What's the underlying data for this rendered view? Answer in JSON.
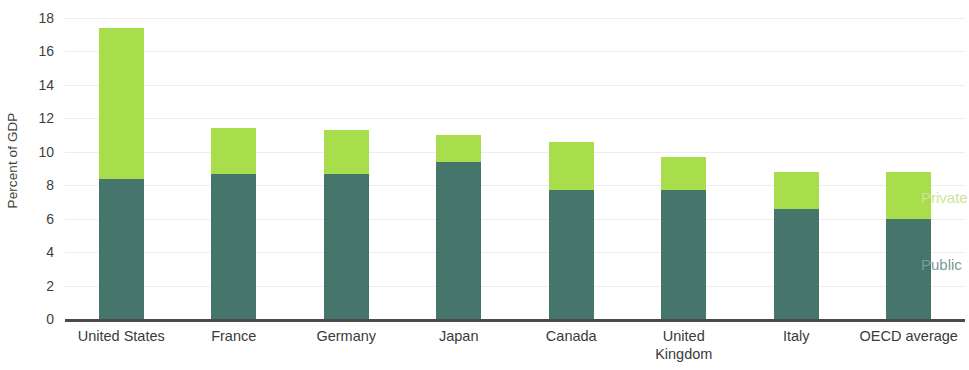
{
  "chart_data": {
    "type": "bar",
    "subtype": "stacked-vertical",
    "title": "",
    "xlabel": "",
    "ylabel": "Percent of GDP",
    "ylim": [
      0,
      18
    ],
    "ytick_step": 2,
    "ytick_labels": [
      "18",
      "16",
      "14",
      "12",
      "10",
      "8",
      "6",
      "4",
      "2",
      "0"
    ],
    "ytick_values": [
      18,
      16,
      14,
      12,
      10,
      8,
      6,
      4,
      2,
      0
    ],
    "grid": true,
    "grid_axis": "y",
    "legend_position": "right-inside",
    "categories": [
      "United States",
      "France",
      "Germany",
      "Japan",
      "Canada",
      "United\nKingdom",
      "Italy",
      "OECD average"
    ],
    "series": [
      {
        "name": "Public",
        "color": "#46756b",
        "values": [
          8.4,
          8.7,
          8.7,
          9.4,
          7.7,
          7.7,
          6.6,
          6.0
        ]
      },
      {
        "name": "Private",
        "color": "#a8dd4c",
        "values": [
          9.0,
          2.7,
          2.6,
          1.6,
          2.9,
          2.0,
          2.2,
          2.8
        ]
      }
    ],
    "totals": [
      17.4,
      11.4,
      11.3,
      11.0,
      10.6,
      9.7,
      8.8,
      8.8
    ]
  },
  "legend": {
    "private_label": "Private",
    "public_label": "Public",
    "private_text_color": "#cfe39a",
    "public_text_color": "#7d9a95"
  },
  "colors": {
    "private": "#a8dd4c",
    "public": "#46756b",
    "axis": "#4a4a4c",
    "grid": "#ededf1",
    "text": "#3f3f41",
    "background": "#ffffff"
  }
}
